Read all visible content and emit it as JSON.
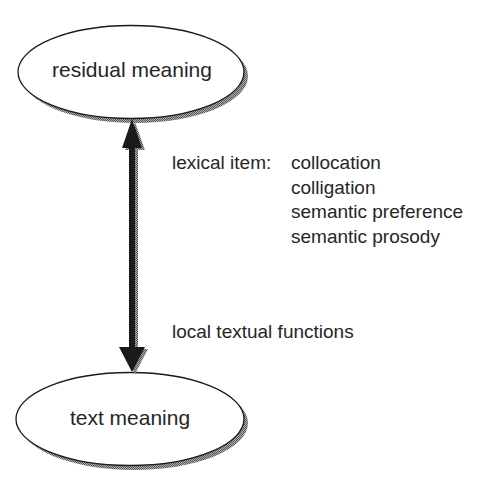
{
  "nodes": {
    "top": {
      "label": "residual meaning"
    },
    "bottom": {
      "label": "text meaning"
    }
  },
  "arrow": {
    "type": "double-headed",
    "labels": {
      "lexical_item_heading": "lexical item:",
      "lexical_item_components": [
        "collocation",
        "colligation",
        "semantic preference",
        "semantic prosody"
      ],
      "lower": "local textual functions"
    }
  },
  "colors": {
    "stroke": "#1a1a1a",
    "shadow": "#8a8a8a",
    "fill": "#ffffff",
    "text": "#262626"
  }
}
